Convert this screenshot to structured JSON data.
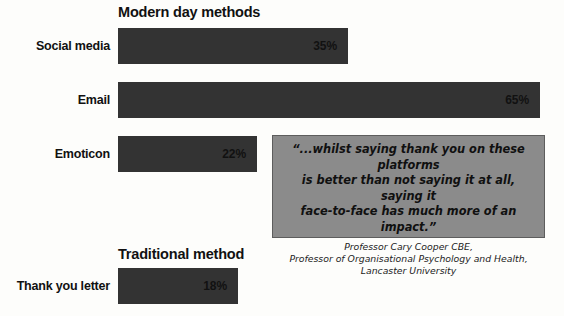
{
  "chart_data": {
    "type": "bar",
    "title": "",
    "orientation": "horizontal",
    "xlabel": "",
    "ylabel": "",
    "xlim": [
      0,
      100
    ],
    "grid": false,
    "legend": null,
    "groups": [
      {
        "heading": "Modern day methods",
        "categories": [
          "Social media",
          "Email",
          "Emoticon"
        ],
        "values": [
          35,
          65,
          22
        ],
        "value_labels": [
          "35%",
          "65%",
          "22%"
        ]
      },
      {
        "heading": "Traditional method",
        "categories": [
          "Thank you letter"
        ],
        "values": [
          18
        ],
        "value_labels": [
          "18%"
        ]
      }
    ],
    "categories": [
      "Social media",
      "Email",
      "Emoticon",
      "Thank you letter"
    ],
    "values": [
      35,
      65,
      22,
      18
    ],
    "annotations": [
      {
        "type": "quote-callout",
        "text": "“...whilst saying thank you on these platforms is better than not saying it at all, saying it face-to-face has much more of an impact.”",
        "attribution": "Professor Cary Cooper CBE, Professor of Organisational Psychology and Health, Lancaster University"
      }
    ],
    "colors": {
      "bar": "#333333",
      "background": "#fdfdfb",
      "callout_fill": "#8b8b8b",
      "callout_border": "#5d5d5d",
      "text": "#111111"
    }
  },
  "headings": {
    "modern": "Modern day methods",
    "traditional": "Traditional method"
  },
  "bars": {
    "social": {
      "label": "Social media",
      "value_label": "35%",
      "width_px": 230
    },
    "email": {
      "label": "Email",
      "value_label": "65%",
      "width_px": 422
    },
    "emoticon": {
      "label": "Emoticon",
      "value_label": "22%",
      "width_px": 139
    },
    "letter": {
      "label": "Thank you letter",
      "value_label": "18%",
      "width_px": 120
    }
  },
  "quote": {
    "line1": "“...whilst saying thank you on these platforms",
    "line2": "is better than not saying it at all, saying it",
    "line3": "face-to-face has much more of an impact.”",
    "attr1": "Professor Cary Cooper CBE,",
    "attr2": "Professor of Organisational Psychology and Health,",
    "attr3": "Lancaster University"
  }
}
